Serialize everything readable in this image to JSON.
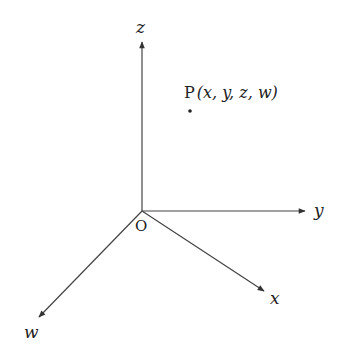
{
  "diagram": {
    "type": "coordinate-axes-4d",
    "colors": {
      "line": "#333333",
      "text": "#222222",
      "background": "#ffffff"
    },
    "origin": {
      "label": "O",
      "x": 142,
      "y": 211
    },
    "axes": [
      {
        "name": "z",
        "label": "z",
        "tip": [
          142,
          41
        ]
      },
      {
        "name": "y",
        "label": "y",
        "tip": [
          306,
          211
        ]
      },
      {
        "name": "x",
        "label": "x",
        "tip": [
          265,
          292
        ]
      },
      {
        "name": "w",
        "label": "w",
        "tip": [
          38,
          318
        ]
      }
    ],
    "point": {
      "name": "P",
      "label_prefix": "P",
      "coords_text": "(x, y, z, w)",
      "x": 190,
      "y": 111
    }
  }
}
